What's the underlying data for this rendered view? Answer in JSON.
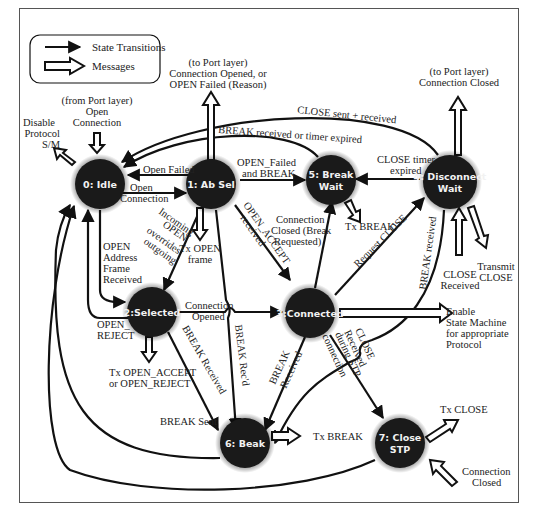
{
  "legend": {
    "transitions_label": "State Transitions",
    "messages_label": "Messages"
  },
  "states": [
    {
      "id": "0",
      "line1": "0: Idle",
      "line2": ""
    },
    {
      "id": "1",
      "line1": "1: Ab Sel",
      "line2": ""
    },
    {
      "id": "2",
      "line1": "2:Selected",
      "line2": ""
    },
    {
      "id": "3",
      "line1": "3:Connected",
      "line2": ""
    },
    {
      "id": "4",
      "line1": "4: Disconnect",
      "line2": "Wait"
    },
    {
      "id": "5",
      "line1": "5: Break",
      "line2": "Wait"
    },
    {
      "id": "6",
      "line1": "6: Beak",
      "line2": ""
    },
    {
      "id": "7",
      "line1": "7: Close",
      "line2": "STP"
    }
  ],
  "transitions": {
    "open_failed": "Open Failed",
    "open_connection": [
      "Open",
      "Connection"
    ],
    "open_failed_and_break": [
      "OPEN_Failed",
      "and BREAK"
    ],
    "close_timer_expired": [
      "CLOSE timer",
      "expired"
    ],
    "close_sent_received": "CLOSE sent + received",
    "break_received_or_timer": "BREAK received or timer expired",
    "incoming_open": [
      "Incoming",
      "OPEN",
      "overrides",
      "outgoing"
    ],
    "open_accept_received": [
      "OPEN_ACCEPT",
      "received"
    ],
    "open_address_frame": [
      "OPEN",
      "Address",
      "Frame",
      "Received"
    ],
    "open_reject": [
      "OPEN_",
      "REJECT"
    ],
    "connection_opened": [
      "Connection",
      "Opened"
    ],
    "connection_closed_break": [
      "Connection",
      "Closed (Break",
      "Requested)"
    ],
    "request_close": "Request CLOSE",
    "break_received_4": "BREAK received",
    "break_received_2": "BREAK Received",
    "break_recd": "BREAK Rec'd",
    "break_received_3": [
      "BREAK",
      "Received"
    ],
    "close_received_stp": [
      "CLOSE",
      "Received",
      "during STP",
      "connection"
    ],
    "break_sent": "BREAK Sent"
  },
  "messages": {
    "from_port_open": [
      "(from Port layer)",
      "Open",
      "Connection"
    ],
    "disable_protocol": [
      "Disable",
      "Protocol",
      "S/M"
    ],
    "to_port_opened": [
      "(to Port layer)",
      "Connection Opened, or",
      "OPEN Failed (Reason)"
    ],
    "to_port_closed": [
      "(to Port layer)",
      "Connection Closed"
    ],
    "tx_open_frame": [
      "Tx OPEN",
      "frame"
    ],
    "tx_break_5": "Tx BREAK",
    "transmit_close": [
      "Transmit",
      "CLOSE"
    ],
    "close_received_4": [
      "CLOSE",
      "Received"
    ],
    "enable_sm": [
      "Enable",
      "State Machine",
      "for appropriate",
      "Protocol"
    ],
    "tx_open_accept": [
      "Tx OPEN_ACCEPT",
      "or OPEN_REJECT"
    ],
    "tx_break_6": "Tx BREAK",
    "tx_close": "Tx CLOSE",
    "connection_closed_7": [
      "Connection",
      "Closed"
    ]
  },
  "colors": {
    "node_fill": "#1a1a1a",
    "node_text": "#f2f2f2",
    "line": "#111111",
    "background": "#ffffff"
  }
}
